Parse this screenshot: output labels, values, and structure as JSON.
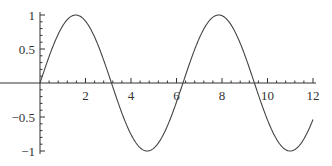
{
  "chart_data": {
    "type": "line",
    "title": "",
    "xlabel": "",
    "ylabel": "",
    "function": "sin(x)",
    "xlim": [
      0,
      12
    ],
    "ylim": [
      -1,
      1
    ],
    "grid": false,
    "legend": "none",
    "x_major_ticks": [
      2,
      4,
      6,
      8,
      10,
      12
    ],
    "x_tick_labels": [
      "2",
      "4",
      "6",
      "8",
      "10",
      "12"
    ],
    "x_minor_step": 0.4,
    "y_major_ticks": [
      -1,
      -0.5,
      0.5,
      1
    ],
    "y_tick_labels": [
      "-1",
      "-0.5",
      "0.5",
      "1"
    ],
    "y_minor_step": 0.1,
    "series": [
      {
        "name": "sin(x)",
        "color": "#444444",
        "x": [
          0,
          0.5,
          1,
          1.5708,
          2,
          2.5,
          3,
          3.1416,
          3.5,
          4,
          4.5,
          4.7124,
          5,
          5.5,
          6,
          6.2832,
          6.5,
          7,
          7.5,
          7.854,
          8,
          8.5,
          9,
          9.4248,
          9.5,
          10,
          10.5,
          10.9956,
          11,
          11.5,
          12
        ],
        "y": [
          0,
          0.479,
          0.841,
          1,
          0.909,
          0.598,
          0.141,
          0,
          -0.351,
          -0.757,
          -0.978,
          -1,
          -0.959,
          -0.706,
          -0.279,
          0,
          0.215,
          0.657,
          0.938,
          1,
          0.989,
          0.798,
          0.412,
          0,
          -0.075,
          -0.544,
          -0.88,
          -1,
          -1,
          -0.875,
          -0.537
        ]
      }
    ]
  }
}
